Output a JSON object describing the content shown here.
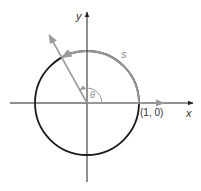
{
  "diagram": {
    "type": "unit-circle-arc-length",
    "labels": {
      "x_axis": "x",
      "y_axis": "y",
      "arc": "s",
      "angle": "θ",
      "point": "(1, 0)"
    },
    "angle_degrees": 119,
    "colors": {
      "axis": "#222222",
      "circle_dark": "#1a1a1a",
      "highlight_gray": "#9a9a9a",
      "label_gray": "#8a8a8a",
      "background": "#ffffff"
    }
  }
}
